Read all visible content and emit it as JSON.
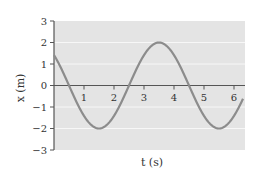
{
  "chart_data": {
    "type": "line",
    "title": "",
    "xlabel": "t (s)",
    "ylabel": "x (m)",
    "xlim": [
      0,
      6.3
    ],
    "ylim": [
      -3,
      3
    ],
    "xticks": [
      1,
      2,
      3,
      4,
      5,
      6
    ],
    "yticks": [
      -3,
      -2,
      -1,
      0,
      1,
      2,
      3
    ],
    "grid": true,
    "legend": null,
    "series": [
      {
        "name": "x(t)",
        "function": "x = 2 cos((pi/2)(t - 3.5))",
        "amplitude": 2,
        "period": 4,
        "x": [
          0,
          0.5,
          1,
          1.5,
          2,
          2.5,
          3,
          3.5,
          4,
          4.5,
          5,
          5.5,
          6,
          6.3
        ],
        "values": [
          1.41,
          0,
          -1.41,
          -2,
          -1.41,
          0,
          1.41,
          2,
          1.41,
          0,
          -1.41,
          -2,
          -1.41,
          -0.91
        ]
      }
    ]
  },
  "colors": {
    "panel": "#e4e4e4",
    "grid": "#f7f7f7",
    "curve": "#8c8c8c",
    "axis": "#555555"
  }
}
